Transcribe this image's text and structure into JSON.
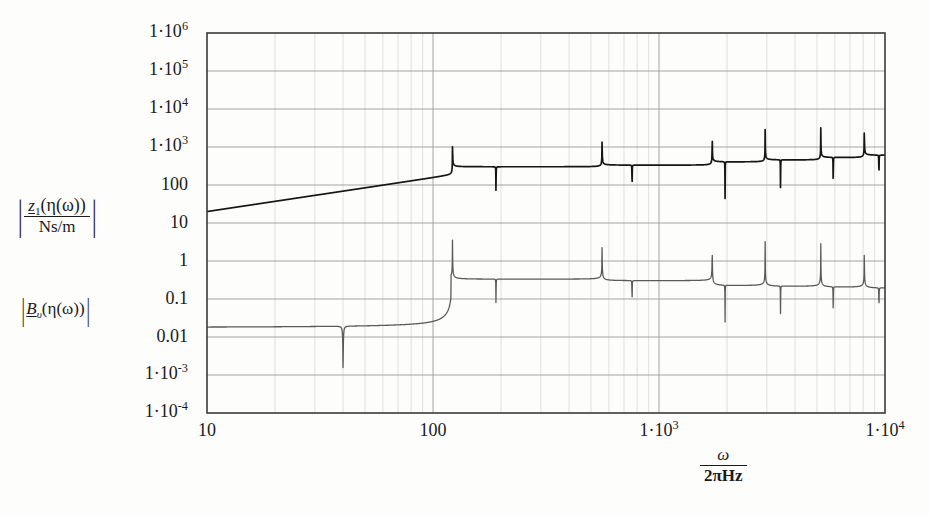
{
  "figure": {
    "background": "#fdfdfb",
    "frame_color": "#3a3a3a",
    "grid_color": "#9a9a9a",
    "grid_minor_color": "#c9c9c9",
    "curve1_color": "#161616",
    "curve2_color": "#5a5a5a"
  },
  "axis_labels": {
    "y_primary_numerator": "z",
    "y_primary_numerator_sub": "1",
    "y_primary_numerator_arg": "(η(ω))",
    "y_primary_denominator": "Ns/m",
    "y_secondary_symbol": "B",
    "y_secondary_sub": "υ",
    "y_secondary_arg": "(η(ω))",
    "x_numerator": "ω",
    "x_denominator": "2πHz"
  },
  "chart_data": {
    "type": "line",
    "title": "",
    "xlabel": "ω / 2πHz",
    "ylabel": "|z_1(η(ω))/Ns/m| , |B_υ(η(ω))|",
    "xscale": "log",
    "yscale": "log",
    "xlim": [
      10,
      10000
    ],
    "ylim": [
      0.0001,
      1000000
    ],
    "grid": true,
    "legend_position": "none",
    "xticks": [
      10,
      100,
      1000,
      10000
    ],
    "xticklabels": [
      "10",
      "100",
      "1·10³",
      "1·10⁴"
    ],
    "yticks": [
      0.0001,
      0.001,
      0.01,
      0.1,
      1,
      10,
      100,
      1000,
      10000,
      100000,
      1000000
    ],
    "yticklabels": [
      "1·10⁻⁴",
      "1·10⁻³",
      "0.01",
      "0.1",
      "1",
      "10",
      "100",
      "1·10³",
      "1·10⁴",
      "1·10⁵",
      "1·10⁶"
    ],
    "series": [
      {
        "name": "|z_1(η(ω))/Ns/m|",
        "color": "#161616",
        "linewidth": 1.7,
        "resonances": [
          122,
          560,
          1720,
          2950,
          5200,
          8100
        ],
        "resonance_peaks": [
          120000.0,
          2000000.0,
          2000000.0,
          2000000.0,
          2000000.0,
          2000000.0
        ],
        "antiresonances": [
          190,
          760,
          1960,
          3450,
          5900,
          9400
        ],
        "antiresonance_minima": [
          8.0,
          7.0,
          10.0,
          12.0,
          14.0,
          16.0
        ],
        "baseline_start": 20,
        "baseline_slope_decade": 7.8,
        "plateau_levels": [
          300,
          330,
          400,
          450,
          520,
          600
        ]
      },
      {
        "name": "|B_υ(η(ω))|",
        "color": "#5a5a5a",
        "linewidth": 1.3,
        "resonances": [
          122,
          560,
          1720,
          2950,
          5200,
          8100
        ],
        "resonance_peaks": [
          20,
          16,
          14,
          12,
          11,
          10
        ],
        "antiresonances": [
          40,
          190,
          760,
          1960,
          3450,
          5900,
          9400
        ],
        "antiresonance_minima": [
          4e-05,
          0.012,
          0.02,
          0.03,
          0.04,
          0.05,
          0.06
        ],
        "baseline_start": 0.018,
        "valley_levels": [
          0.33,
          0.3,
          0.22,
          0.21,
          0.2,
          0.19
        ]
      }
    ]
  }
}
